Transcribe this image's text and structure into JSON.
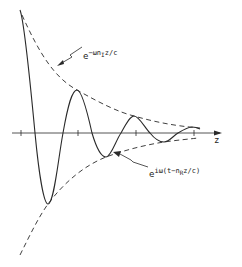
{
  "figure": {
    "axis": {
      "label": "z",
      "y": 133,
      "x_start": 12,
      "x_end": 222,
      "ticks_x": [
        21,
        78,
        136,
        194
      ]
    },
    "labels": {
      "envelope": {
        "base": "e",
        "exponent": "−ωn",
        "subscript": "I",
        "exponent_tail": "z/c"
      },
      "wave": {
        "base": "e",
        "exponent": "iω(t−n",
        "subscript": "R",
        "exponent_tail": "z/c)"
      }
    },
    "colors": {
      "stroke": "#2a2a2a",
      "background": "#ffffff"
    }
  }
}
